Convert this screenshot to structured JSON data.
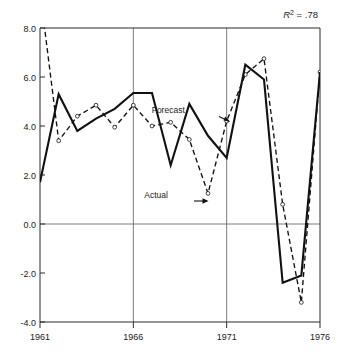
{
  "chart_data": {
    "type": "line",
    "title": "",
    "subtitle": "",
    "xlabel": "",
    "ylabel": "",
    "annotation": "R² = .78",
    "annotation_prefix": "R",
    "annotation_exponent": "2",
    "annotation_value": " = .78",
    "grid": true,
    "grid_axis": "both",
    "gridlines_x": [
      1966,
      1971
    ],
    "gridlines_y": [
      0.0
    ],
    "legend_position": "inline-annotations",
    "xlim": [
      1961,
      1976
    ],
    "ylim": [
      -4.0,
      8.0
    ],
    "xticks": [
      1961,
      1966,
      1971,
      1976
    ],
    "xtick_labels": [
      "1961",
      "1966",
      "1971",
      "1976"
    ],
    "yticks": [
      -4.0,
      -2.0,
      0.0,
      2.0,
      4.0,
      6.0,
      8.0
    ],
    "ytick_labels": [
      "-4.0",
      "-2.0",
      "0.0",
      "2.0",
      "4.0",
      "6.0",
      "8.0"
    ],
    "x": [
      1961,
      1962,
      1963,
      1964,
      1965,
      1966,
      1967,
      1968,
      1969,
      1970,
      1971,
      1972,
      1973,
      1974,
      1975,
      1976
    ],
    "series": [
      {
        "name": "Actual",
        "style": "solid",
        "marker": "none",
        "values": [
          1.7,
          5.3,
          3.8,
          4.3,
          4.7,
          5.35,
          5.35,
          2.4,
          4.9,
          3.6,
          2.7,
          6.5,
          5.9,
          -2.4,
          -2.1,
          6.2
        ]
      },
      {
        "name": "Forecast",
        "style": "dashed",
        "marker": "open-circle",
        "values": [
          9.5,
          3.4,
          4.4,
          4.85,
          3.95,
          4.85,
          4.0,
          4.15,
          3.45,
          1.25,
          4.2,
          6.1,
          6.75,
          0.8,
          -3.2,
          6.2
        ]
      }
    ],
    "annotations": [
      {
        "label": "Forecast",
        "x": 1969.45,
        "y": 4.55
      },
      {
        "label": "Actual",
        "x": 1968.25,
        "y": 1.05
      }
    ]
  }
}
